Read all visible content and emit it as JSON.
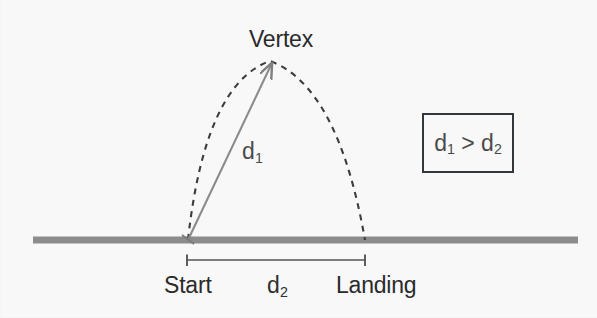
{
  "figure": {
    "type": "projectile-trajectory-diagram",
    "background_color": "#f7f7f8",
    "labels": {
      "vertex": "Vertex",
      "start": "Start",
      "landing": "Landing",
      "d1_base": "d",
      "d1_sub": "1",
      "d2_base": "d",
      "d2_sub": "2"
    },
    "comparison": {
      "left_base": "d",
      "left_sub": "1",
      "operator": ">",
      "right_base": "d",
      "right_sub": "2",
      "border_color": "#33373a"
    },
    "colors": {
      "ground": "#8c8c8c",
      "trajectory": "#3a3a3a",
      "arrow": "#8a8a8a",
      "measure_bar": "#555555",
      "text": "#2a2a2a"
    },
    "geometry": {
      "ground_line": {
        "x1": 33,
        "y1": 240,
        "x2": 578,
        "y2": 240,
        "thickness": 7
      },
      "trajectory": {
        "start_x": 188,
        "start_y": 240,
        "apex_x": 270,
        "apex_y": 61,
        "land_x": 365,
        "land_y": 240
      },
      "d1_arrow": {
        "x1": 188,
        "y1": 240,
        "x2": 273,
        "y2": 62
      },
      "d2_measure": {
        "x1": 187,
        "x2": 365,
        "y": 260,
        "tick_height": 11
      }
    }
  }
}
